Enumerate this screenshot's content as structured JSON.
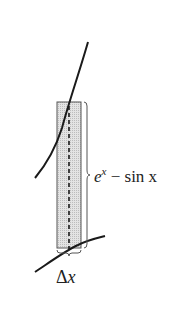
{
  "figure": {
    "type": "area-between-curves-strip",
    "colors": {
      "background": "#ffffff",
      "curve": "#1a1a1a",
      "strip_fill": "#d8d8d8",
      "strip_stroke": "#555555",
      "dashed_line": "#1a1a1a",
      "brace": "#555555",
      "text": "#222222"
    },
    "labels": {
      "height_label_base": "e",
      "height_label_exp": "x",
      "height_label_rest": " − sin x",
      "width_label_delta": "Δ",
      "width_label_var": "x"
    },
    "elements": {
      "upper_curve": "y = e^x",
      "lower_curve": "y = sin x",
      "strip": "representative rectangle",
      "height_brace": "height of rectangle",
      "width_brace": "width of rectangle"
    }
  }
}
